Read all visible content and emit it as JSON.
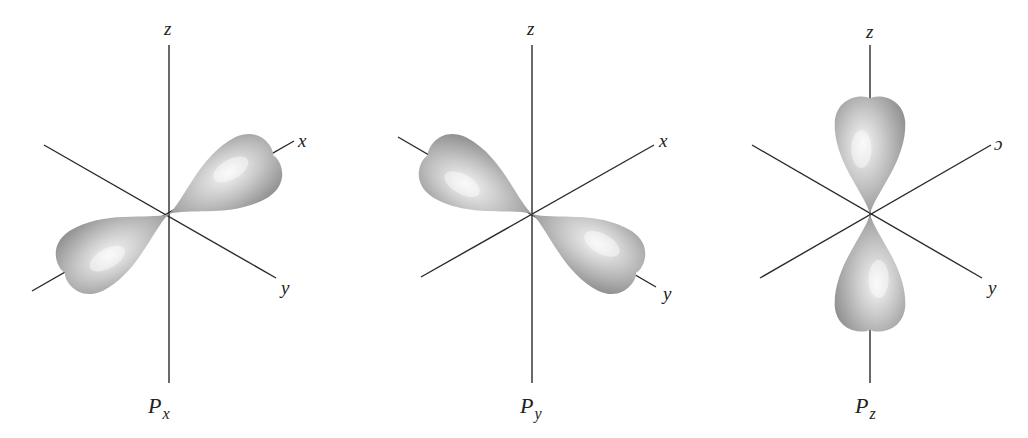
{
  "figure": {
    "lobe_colors": {
      "light": "#f4f4f4",
      "mid": "#bdbdbd",
      "dark": "#8f8f8f"
    },
    "axis_color": "#2a2a2a",
    "panels": [
      {
        "id": "px",
        "title_main": "P",
        "title_sub": "x",
        "title_pos": [
          148,
          413
        ],
        "origin": [
          169,
          214
        ],
        "axes": {
          "z": {
            "from": [
              169,
              45
            ],
            "to": [
              169,
              383
            ],
            "label": "z",
            "label_pos": [
              164,
              35
            ]
          },
          "x": {
            "from": [
              32,
              291
            ],
            "to": [
              294,
              141
            ],
            "label": "x",
            "label_pos": [
              298,
              147
            ]
          },
          "y": {
            "from": [
              44,
              145
            ],
            "to": [
              276,
              278
            ],
            "label": "y",
            "label_pos": [
              281,
              294
            ]
          }
        },
        "lobes": [
          {
            "tip_angle_deg": -29.5,
            "length": 122,
            "width": 70,
            "highlight": [
              0.62,
              0.45
            ]
          },
          {
            "tip_angle_deg": 150.5,
            "length": 122,
            "width": 70,
            "highlight": [
              0.62,
              0.45
            ]
          }
        ]
      },
      {
        "id": "py",
        "title_main": "P",
        "title_sub": "y",
        "title_pos": [
          520,
          413
        ],
        "origin": [
          532,
          214
        ],
        "axes": {
          "z": {
            "from": [
              532,
              45
            ],
            "to": [
              532,
              383
            ],
            "label": "z",
            "label_pos": [
              527,
              35
            ]
          },
          "x": {
            "from": [
              421,
              277
            ],
            "to": [
              654,
              145
            ],
            "label": "x",
            "label_pos": [
              659,
              147
            ]
          },
          "y": {
            "from": [
              398,
              137
            ],
            "to": [
              656,
              287
            ],
            "label": "y",
            "label_pos": [
              663,
              300
            ]
          }
        },
        "lobes": [
          {
            "tip_angle_deg": -150.5,
            "length": 122,
            "width": 70,
            "highlight": [
              0.62,
              0.45
            ]
          },
          {
            "tip_angle_deg": 29.5,
            "length": 122,
            "width": 70,
            "highlight": [
              0.62,
              0.45
            ]
          }
        ]
      },
      {
        "id": "pz",
        "title_main": "P",
        "title_sub": "z",
        "title_pos": [
          855,
          413
        ],
        "origin": [
          870,
          214
        ],
        "axes": {
          "z": {
            "from": [
              870,
              45
            ],
            "to": [
              870,
              383
            ],
            "label": "z",
            "label_pos": [
              866,
              38
            ]
          },
          "x": {
            "from": [
              760,
              278
            ],
            "to": [
              991,
              145
            ],
            "label": "ɔ",
            "label_pos": [
              994,
              150
            ]
          },
          "y": {
            "from": [
              752,
              145
            ],
            "to": [
              982,
              278
            ],
            "label": "y",
            "label_pos": [
              988,
              294
            ]
          }
        },
        "lobes": [
          {
            "tip_angle_deg": -90,
            "length": 118,
            "width": 72,
            "highlight": [
              0.55,
              0.45
            ]
          },
          {
            "tip_angle_deg": 90,
            "length": 118,
            "width": 72,
            "highlight": [
              0.55,
              0.45
            ]
          }
        ]
      }
    ]
  }
}
